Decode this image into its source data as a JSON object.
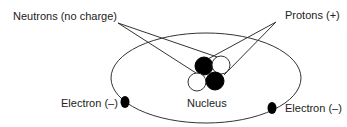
{
  "diagram": {
    "labels": {
      "neutrons": "Neutrons (no charge)",
      "protons": "Protons (+)",
      "nucleus": "Nucleus",
      "electron_left": "Electron (–)",
      "electron_right": "Electron (–)"
    },
    "nucleus_particles": [
      {
        "type": "proton",
        "fill": "#000000"
      },
      {
        "type": "neutron",
        "fill": "#ffffff"
      },
      {
        "type": "neutron",
        "fill": "#ffffff"
      },
      {
        "type": "proton",
        "fill": "#000000"
      }
    ],
    "electrons": [
      {
        "side": "left"
      },
      {
        "side": "right"
      }
    ],
    "colors": {
      "stroke": "#333333",
      "proton": "#000000",
      "neutron": "#ffffff",
      "electron": "#000000"
    }
  }
}
